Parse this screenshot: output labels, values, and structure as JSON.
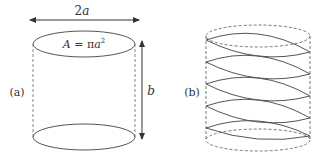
{
  "figure": {
    "panel_a": {
      "label": "(a)",
      "width_label_num": "2",
      "width_label_var": "a",
      "area_label_prefix": "A = π",
      "area_label_var": "a",
      "area_label_exp": "2",
      "height_label": "b"
    },
    "panel_b": {
      "label": "(b)",
      "helix_turns": 5
    },
    "colors": {
      "stroke": "#555555",
      "dashed": "#777777",
      "text": "#333333"
    }
  }
}
